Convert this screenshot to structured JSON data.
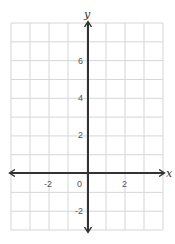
{
  "chart_data": {
    "type": "scatter",
    "title": "",
    "xlabel": "x",
    "ylabel": "y",
    "xlim": [
      -4,
      4
    ],
    "ylim": [
      -3,
      8
    ],
    "grid": true,
    "grid_step": 1,
    "x_ticks": [
      {
        "value": -2,
        "label": "-2"
      },
      {
        "value": 0,
        "label": "0"
      },
      {
        "value": 2,
        "label": "2"
      }
    ],
    "y_ticks": [
      {
        "value": 6,
        "label": "6"
      },
      {
        "value": 4,
        "label": "4"
      },
      {
        "value": 2,
        "label": "2"
      },
      {
        "value": -2,
        "label": "-2"
      }
    ],
    "series": [],
    "colors": {
      "grid": "#d6d6d6",
      "axis": "#333333",
      "tick_text": "#555555"
    }
  },
  "labels": {
    "x_axis": "x",
    "y_axis": "y",
    "origin": "0",
    "x_neg2": "-2",
    "x_pos2": "2",
    "y_6": "6",
    "y_4": "4",
    "y_2": "2",
    "y_neg2": "-2"
  }
}
